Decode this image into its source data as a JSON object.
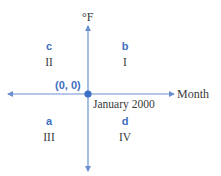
{
  "diagram": {
    "type": "coordinate-plane",
    "y_axis_label": "°F",
    "x_axis_label": "Month",
    "origin_label": "(0, 0)",
    "origin_caption": "January 2000",
    "colors": {
      "axis": "#6a8fd0",
      "origin_dot": "#3a6fc4",
      "letter": "#3f6fc0",
      "text": "#3a3a3a"
    },
    "quadrants": [
      {
        "letter": "b",
        "numeral": "I"
      },
      {
        "letter": "c",
        "numeral": "II"
      },
      {
        "letter": "a",
        "numeral": "III"
      },
      {
        "letter": "d",
        "numeral": "IV"
      }
    ]
  }
}
